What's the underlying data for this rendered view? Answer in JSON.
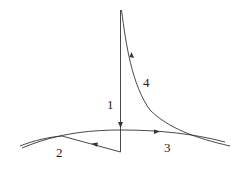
{
  "diagram": {
    "type": "phase-trajectory",
    "labels": {
      "segment_1": "1",
      "segment_2": "2",
      "segment_3": "3",
      "segment_4": "4"
    },
    "colors": {
      "stroke": "#333333",
      "background": "#ffffff"
    }
  }
}
